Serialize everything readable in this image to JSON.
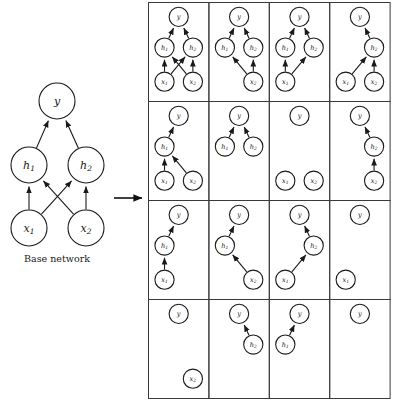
{
  "figure": {
    "caption": "Base network",
    "transition_arrow": "right-arrow",
    "node_labels": {
      "y": "y",
      "h1": "h₁",
      "h2": "h₂",
      "x1": "x₁",
      "x2": "x₂"
    }
  },
  "base_network": {
    "name": "Base network",
    "nodes": [
      {
        "id": "y",
        "label": "y",
        "sub": "",
        "cx": 57,
        "cy": 101,
        "r": 18
      },
      {
        "id": "h1",
        "label": "h",
        "sub": "1",
        "cx": 29,
        "cy": 165,
        "r": 18
      },
      {
        "id": "h2",
        "label": "h",
        "sub": "2",
        "cx": 86,
        "cy": 165,
        "r": 18
      },
      {
        "id": "x1",
        "label": "x",
        "sub": "1",
        "cx": 29,
        "cy": 228,
        "r": 18
      },
      {
        "id": "x2",
        "label": "x",
        "sub": "2",
        "cx": 86,
        "cy": 228,
        "r": 18
      }
    ],
    "edges": [
      {
        "from": "h1",
        "to": "y"
      },
      {
        "from": "h2",
        "to": "y"
      },
      {
        "from": "x1",
        "to": "h1"
      },
      {
        "from": "x1",
        "to": "h2"
      },
      {
        "from": "x2",
        "to": "h1"
      },
      {
        "from": "x2",
        "to": "h2"
      }
    ]
  },
  "grid": {
    "rows": 4,
    "cols": 4,
    "cells": [
      {
        "index": 1,
        "row": 1,
        "col": 1,
        "nodes": [
          "y",
          "h1",
          "h2",
          "x1",
          "x2"
        ],
        "edges": [
          [
            "h1",
            "y"
          ],
          [
            "h2",
            "y"
          ],
          [
            "x1",
            "h1"
          ],
          [
            "x1",
            "h2"
          ],
          [
            "x2",
            "h1"
          ],
          [
            "x2",
            "h2"
          ]
        ]
      },
      {
        "index": 2,
        "row": 1,
        "col": 2,
        "nodes": [
          "y",
          "h1",
          "h2",
          "x2"
        ],
        "edges": [
          [
            "h1",
            "y"
          ],
          [
            "h2",
            "y"
          ],
          [
            "x2",
            "h1"
          ],
          [
            "x2",
            "h2"
          ]
        ]
      },
      {
        "index": 3,
        "row": 1,
        "col": 3,
        "nodes": [
          "y",
          "h1",
          "h2",
          "x1"
        ],
        "edges": [
          [
            "h1",
            "y"
          ],
          [
            "h2",
            "y"
          ],
          [
            "x1",
            "h1"
          ],
          [
            "x1",
            "h2"
          ]
        ]
      },
      {
        "index": 4,
        "row": 1,
        "col": 4,
        "nodes": [
          "y",
          "h2",
          "x1",
          "x2"
        ],
        "edges": [
          [
            "h2",
            "y"
          ],
          [
            "x1",
            "h2"
          ],
          [
            "x2",
            "h2"
          ]
        ]
      },
      {
        "index": 5,
        "row": 2,
        "col": 1,
        "nodes": [
          "y",
          "h1",
          "x1",
          "x2"
        ],
        "edges": [
          [
            "h1",
            "y"
          ],
          [
            "x1",
            "h1"
          ],
          [
            "x2",
            "h1"
          ]
        ]
      },
      {
        "index": 6,
        "row": 2,
        "col": 2,
        "nodes": [
          "y",
          "h1",
          "h2"
        ],
        "edges": [
          [
            "h1",
            "y"
          ],
          [
            "h2",
            "y"
          ]
        ]
      },
      {
        "index": 7,
        "row": 2,
        "col": 3,
        "nodes": [
          "y",
          "x1",
          "x2"
        ],
        "edges": []
      },
      {
        "index": 8,
        "row": 2,
        "col": 4,
        "nodes": [
          "y",
          "h2",
          "x2"
        ],
        "edges": [
          [
            "h2",
            "y"
          ],
          [
            "x2",
            "h2"
          ]
        ]
      },
      {
        "index": 9,
        "row": 3,
        "col": 1,
        "nodes": [
          "y",
          "h1",
          "x1"
        ],
        "edges": [
          [
            "h1",
            "y"
          ],
          [
            "x1",
            "h1"
          ]
        ]
      },
      {
        "index": 10,
        "row": 3,
        "col": 2,
        "nodes": [
          "y",
          "h1",
          "x2"
        ],
        "edges": [
          [
            "h1",
            "y"
          ],
          [
            "x2",
            "h1"
          ]
        ]
      },
      {
        "index": 11,
        "row": 3,
        "col": 3,
        "nodes": [
          "y",
          "h2",
          "x1"
        ],
        "edges": [
          [
            "h2",
            "y"
          ],
          [
            "x1",
            "h2"
          ]
        ]
      },
      {
        "index": 12,
        "row": 3,
        "col": 4,
        "nodes": [
          "y",
          "x1"
        ],
        "edges": []
      },
      {
        "index": 13,
        "row": 4,
        "col": 1,
        "nodes": [
          "y",
          "x2"
        ],
        "edges": []
      },
      {
        "index": 14,
        "row": 4,
        "col": 2,
        "nodes": [
          "y",
          "h2"
        ],
        "edges": [
          [
            "h2",
            "y"
          ]
        ]
      },
      {
        "index": 15,
        "row": 4,
        "col": 3,
        "nodes": [
          "y",
          "h1"
        ],
        "edges": [
          [
            "h1",
            "y"
          ]
        ]
      },
      {
        "index": 16,
        "row": 4,
        "col": 4,
        "nodes": [
          "y"
        ],
        "edges": []
      }
    ]
  },
  "colors": {
    "stroke": "#1a1a1a",
    "cell_border": "#3a3a3a",
    "node_fill": "#ffffff",
    "background": "#ffffff"
  }
}
